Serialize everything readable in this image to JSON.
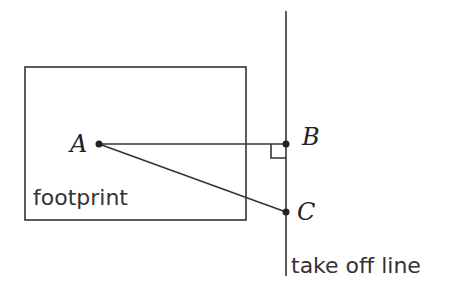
{
  "diagram": {
    "title": "",
    "footprint": {
      "label": "footprint",
      "x": 25,
      "y": 67,
      "width": 221,
      "height": 153
    },
    "take_off_line": {
      "label": "take off line",
      "x": 286,
      "y1": 11,
      "y2": 276
    },
    "points": {
      "A": {
        "label": "A",
        "x": 99,
        "y": 144
      },
      "B": {
        "label": "B",
        "x": 286,
        "y": 144
      },
      "C": {
        "label": "C",
        "x": 286,
        "y": 212
      }
    },
    "segments": [
      "AB",
      "AC"
    ],
    "right_angle_at": "B",
    "colors": {
      "line": "#333333",
      "background": "#ffffff"
    }
  }
}
